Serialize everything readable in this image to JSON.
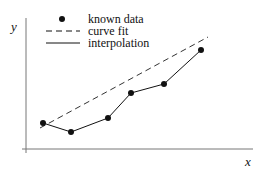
{
  "chart_data": {
    "type": "line",
    "title": "",
    "xlabel": "x",
    "ylabel": "y",
    "grid": false,
    "legend_position": "upper-left",
    "legend": [
      {
        "label": "known data",
        "style": "marker"
      },
      {
        "label": "curve fit",
        "style": "dashed"
      },
      {
        "label": "interpolation",
        "style": "solid"
      }
    ],
    "known_data": {
      "x": [
        1,
        2,
        3.3,
        4.1,
        5.2,
        6.5
      ],
      "y": [
        1.5,
        1.1,
        1.7,
        2.8,
        3.2,
        4.7
      ]
    },
    "curve_fit": {
      "x": [
        0.9,
        6.8
      ],
      "y": [
        1.2,
        5.2
      ]
    },
    "interpolation": {
      "x": [
        1,
        2,
        3.3,
        4.1,
        5.2,
        6.5
      ],
      "y": [
        1.5,
        1.1,
        1.7,
        2.8,
        3.2,
        4.7
      ]
    },
    "pixel_points": [
      [
        43,
        123
      ],
      [
        71,
        132
      ],
      [
        108,
        118
      ],
      [
        131,
        93
      ],
      [
        164,
        84
      ],
      [
        201,
        50
      ]
    ],
    "fit_pixels": [
      [
        40,
        128
      ],
      [
        208,
        37
      ]
    ]
  },
  "legend": {
    "items": [
      "known data",
      "curve fit",
      "interpolation"
    ]
  },
  "axes": {
    "x_label": "x",
    "y_label": "y"
  }
}
